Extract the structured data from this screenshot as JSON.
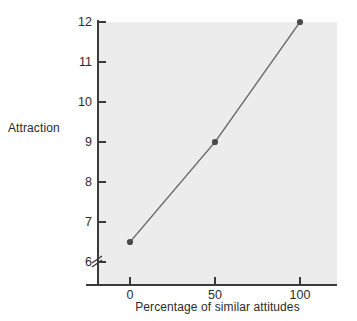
{
  "chart_data": {
    "type": "line",
    "title": "",
    "xlabel": "Percentage of similar attitudes",
    "ylabel": "Attraction",
    "x": [
      0,
      50,
      100
    ],
    "values": [
      6.5,
      9,
      12
    ],
    "series": [
      {
        "name": "Attraction",
        "x": [
          0,
          50,
          100
        ],
        "values": [
          6.5,
          9,
          12
        ]
      }
    ],
    "xticks": [
      0,
      50,
      100
    ],
    "xtick_labels": [
      "0",
      "50",
      "100"
    ],
    "yticks": [
      6,
      7,
      8,
      9,
      10,
      11,
      12
    ],
    "ytick_labels": [
      "6",
      "7",
      "8",
      "9",
      "10",
      "11",
      "12"
    ],
    "xlim": [
      -15,
      125
    ],
    "ylim": [
      5.6,
      12.2
    ],
    "y_axis_break": true,
    "grid": false,
    "legend": false,
    "legend_position": "none",
    "marker": "circle",
    "colors": {
      "line": "#6d6d6d",
      "marker": "#4a4a4a",
      "plot_background": "#ececec",
      "figure_background": "#ffffff",
      "axis": "#3a3a3a",
      "text": "#2b2b2b"
    }
  },
  "axes": {
    "y_label": "Attraction",
    "x_label": "Percentage of similar attitudes",
    "y_ticks": [
      {
        "label": "12",
        "value": 12
      },
      {
        "label": "11",
        "value": 11
      },
      {
        "label": "10",
        "value": 10
      },
      {
        "label": "9",
        "value": 9
      },
      {
        "label": "8",
        "value": 8
      },
      {
        "label": "7",
        "value": 7
      },
      {
        "label": "6",
        "value": 6
      }
    ],
    "x_ticks": [
      {
        "label": "0",
        "value": 0
      },
      {
        "label": "50",
        "value": 50
      },
      {
        "label": "100",
        "value": 100
      }
    ]
  },
  "points": [
    {
      "x": 0,
      "y": 6.5
    },
    {
      "x": 50,
      "y": 9
    },
    {
      "x": 100,
      "y": 12
    }
  ]
}
